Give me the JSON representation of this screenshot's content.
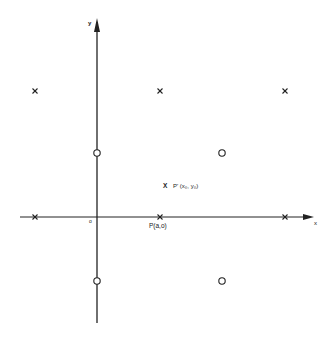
{
  "diagram": {
    "axes": {
      "x_label": "x",
      "y_label": "y",
      "origin_label": "o"
    },
    "cross_marks": [
      {
        "x": 35,
        "y": 91
      },
      {
        "x": 160,
        "y": 91
      },
      {
        "x": 285,
        "y": 91
      },
      {
        "x": 35,
        "y": 217
      },
      {
        "x": 160,
        "y": 217
      },
      {
        "x": 285,
        "y": 217
      }
    ],
    "circle_marks": [
      {
        "x": 97,
        "y": 153
      },
      {
        "x": 222,
        "y": 153
      },
      {
        "x": 97,
        "y": 281
      },
      {
        "x": 222,
        "y": 281
      }
    ],
    "labels": {
      "point_p": "P(a,o)",
      "point_p_prime_marker": "X",
      "point_p_prime": "P' (x₀, y₀)"
    },
    "colors": {
      "line": "#222222",
      "background": "#ffffff"
    }
  }
}
